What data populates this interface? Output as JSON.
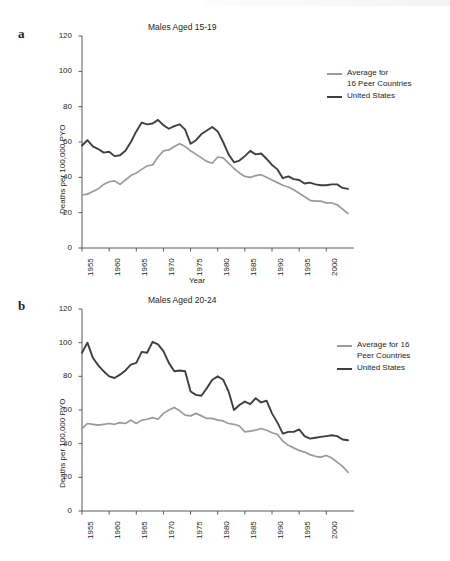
{
  "figure": {
    "panels": [
      {
        "letter": "a",
        "title": "Males Aged 15-19",
        "xlabel": "Year",
        "ylabel": "Deaths per 100,000 PYO",
        "legend": [
          {
            "name": "Average for\n16 Peer Countries",
            "color": "#9a9a9a"
          },
          {
            "name": "United States",
            "color": "#3f3f3f"
          }
        ]
      },
      {
        "letter": "b",
        "title": "Males Aged 20-24",
        "xlabel": "",
        "ylabel": "Deaths per 100,000 PYO",
        "legend": [
          {
            "name": "Average for 16\nPeer Countries",
            "color": "#9a9a9a"
          },
          {
            "name": "United States",
            "color": "#3f3f3f"
          }
        ]
      }
    ]
  },
  "chart_data": [
    {
      "type": "line",
      "panel": "a",
      "title": "Males Aged 15-19",
      "xlabel": "Year",
      "ylabel": "Deaths per 100,000 PYO",
      "xlim": [
        1955,
        2004
      ],
      "ylim": [
        0,
        120
      ],
      "yticks": [
        0,
        20,
        40,
        60,
        80,
        100,
        120
      ],
      "xticks": [
        1955,
        1960,
        1965,
        1970,
        1975,
        1980,
        1985,
        1990,
        1995,
        2000
      ],
      "grid": false,
      "legend_position": "upper-right",
      "x": [
        1955,
        1956,
        1957,
        1958,
        1959,
        1960,
        1961,
        1962,
        1963,
        1964,
        1965,
        1966,
        1967,
        1968,
        1969,
        1970,
        1971,
        1972,
        1973,
        1974,
        1975,
        1976,
        1977,
        1978,
        1979,
        1980,
        1981,
        1982,
        1983,
        1984,
        1985,
        1986,
        1987,
        1988,
        1989,
        1990,
        1991,
        1992,
        1993,
        1994,
        1995,
        1996,
        1997,
        1998,
        1999,
        2000,
        2001,
        2002,
        2003,
        2004
      ],
      "series": [
        {
          "name": "United States",
          "color": "#3f3f3f",
          "values": [
            58.0,
            61.0,
            57.5,
            56.0,
            54.0,
            54.5,
            52.0,
            52.5,
            55.0,
            60.0,
            66.0,
            71.0,
            70.0,
            70.5,
            72.5,
            69.5,
            67.5,
            69.0,
            70.0,
            67.0,
            59.0,
            61.0,
            64.5,
            66.5,
            68.5,
            66.0,
            60.0,
            53.0,
            48.5,
            49.5,
            52.0,
            55.0,
            53.0,
            53.5,
            50.5,
            47.0,
            44.5,
            39.5,
            40.5,
            39.0,
            38.5,
            36.5,
            37.0,
            36.0,
            35.5,
            35.5,
            36.0,
            36.0,
            34.0,
            33.5
          ]
        },
        {
          "name": "Average for 16 Peer Countries",
          "color": "#9a9a9a",
          "values": [
            30.0,
            30.5,
            32.0,
            33.5,
            36.0,
            37.5,
            38.0,
            36.0,
            38.5,
            41.0,
            42.5,
            44.5,
            46.5,
            47.0,
            51.5,
            55.0,
            55.5,
            57.5,
            59.0,
            57.5,
            55.0,
            53.0,
            51.0,
            49.0,
            48.0,
            51.5,
            51.0,
            48.0,
            45.0,
            42.5,
            40.5,
            40.0,
            41.0,
            41.5,
            40.0,
            38.5,
            37.0,
            35.5,
            34.5,
            33.0,
            31.0,
            29.0,
            27.0,
            26.5,
            26.5,
            25.5,
            25.5,
            24.5,
            22.0,
            19.5
          ]
        }
      ]
    },
    {
      "type": "line",
      "panel": "b",
      "title": "Males Aged 20-24",
      "xlabel": "",
      "ylabel": "Deaths per 100,000 PYO",
      "xlim": [
        1955,
        2004
      ],
      "ylim": [
        0,
        120
      ],
      "yticks": [
        0,
        20,
        40,
        60,
        80,
        100,
        120
      ],
      "xticks": [
        1955,
        1960,
        1965,
        1970,
        1975,
        1980,
        1985,
        1990,
        1995,
        2000
      ],
      "grid": false,
      "legend_position": "upper-right",
      "x": [
        1955,
        1956,
        1957,
        1958,
        1959,
        1960,
        1961,
        1962,
        1963,
        1964,
        1965,
        1966,
        1967,
        1968,
        1969,
        1970,
        1971,
        1972,
        1973,
        1974,
        1975,
        1976,
        1977,
        1978,
        1979,
        1980,
        1981,
        1982,
        1983,
        1984,
        1985,
        1986,
        1987,
        1988,
        1989,
        1990,
        1991,
        1992,
        1993,
        1994,
        1995,
        1996,
        1997,
        1998,
        1999,
        2000,
        2001,
        2002,
        2003,
        2004
      ],
      "series": [
        {
          "name": "United States",
          "color": "#3f3f3f",
          "values": [
            94.0,
            100.0,
            91.0,
            86.5,
            83.0,
            80.0,
            79.0,
            81.0,
            83.5,
            87.0,
            88.0,
            94.5,
            94.0,
            100.5,
            99.0,
            95.0,
            88.0,
            83.0,
            83.5,
            83.0,
            71.0,
            69.0,
            68.5,
            73.0,
            78.0,
            80.0,
            78.0,
            71.0,
            60.0,
            63.0,
            65.0,
            63.5,
            67.0,
            64.5,
            65.5,
            58.0,
            52.5,
            46.0,
            47.0,
            47.0,
            48.5,
            44.5,
            43.0,
            43.5,
            44.0,
            44.5,
            45.0,
            44.5,
            42.5,
            42.0
          ]
        },
        {
          "name": "Average for 16 Peer Countries",
          "color": "#9a9a9a",
          "values": [
            49.0,
            52.0,
            51.5,
            51.0,
            51.5,
            52.0,
            51.5,
            52.5,
            52.0,
            54.0,
            52.0,
            54.0,
            54.5,
            55.5,
            54.5,
            58.0,
            60.0,
            61.5,
            59.5,
            57.0,
            56.5,
            58.0,
            56.5,
            55.0,
            55.0,
            54.0,
            53.5,
            52.0,
            51.5,
            50.5,
            47.0,
            47.5,
            48.0,
            49.0,
            48.0,
            46.5,
            45.5,
            41.5,
            39.0,
            37.5,
            36.0,
            35.0,
            33.5,
            32.5,
            32.0,
            33.0,
            31.5,
            29.0,
            26.5,
            23.0
          ]
        }
      ]
    }
  ]
}
